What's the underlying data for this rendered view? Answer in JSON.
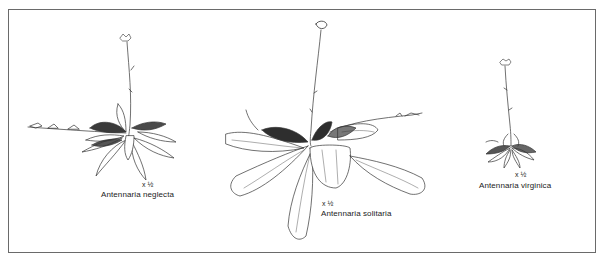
{
  "plate": {
    "border_color": "#6a6a6a",
    "figures": [
      {
        "species": "Antennaria neglecta",
        "scale": "x ½"
      },
      {
        "species": "Antennaria solitaria",
        "scale": "x ½"
      },
      {
        "species": "Antennaria virginica",
        "scale": "x ½"
      }
    ]
  }
}
